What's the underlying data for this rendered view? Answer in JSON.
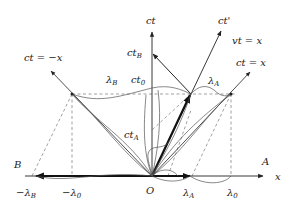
{
  "diagram": {
    "type": "spacetime (Minkowski) diagram",
    "axes": {
      "x_label": "x",
      "ct_label": "ct",
      "ct_prime_label": "ct'",
      "origin_label": "O"
    },
    "lines": {
      "light_right": "ct = x",
      "light_left": "ct = −x",
      "moving_worldline": "vt = x"
    },
    "points": {
      "A": "A",
      "B": "B"
    },
    "time_marks": {
      "ct_B": "ct",
      "ct_B_sub": "B",
      "ct_0": "ct",
      "ct_0_sub": "0",
      "ct_A": "ct",
      "ct_A_sub": "A"
    },
    "wavelengths": {
      "lambda_B": "λ",
      "lambda_B_sub": "B",
      "lambda_A": "λ",
      "lambda_A_sub": "A",
      "minus_lambda_B": "−λ",
      "minus_lambda_B_sub": "B",
      "minus_lambda_0": "−λ",
      "minus_lambda_0_sub": "0",
      "x_lambda_A": "λ",
      "x_lambda_A_sub": "A",
      "x_lambda_0": "λ",
      "x_lambda_0_sub": "0"
    },
    "colors": {
      "line": "#222222",
      "dashed": "#888888",
      "wave": "#555555"
    }
  }
}
